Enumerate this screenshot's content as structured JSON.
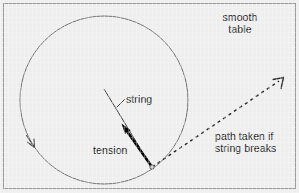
{
  "figure": {
    "background_color": "#eeeeee",
    "border_color": "#9a9a9a",
    "ink_color": "#1a1a1a",
    "thin_line_color": "#6e6e6e",
    "labels": {
      "smooth_table": "smooth\ntable",
      "string": "string",
      "tension": "tension",
      "path_broken": "path taken if\nstring breaks"
    },
    "geometry": {
      "frame": {
        "x": 3,
        "y": 3,
        "width": 293,
        "height": 186
      },
      "circle": {
        "cx": 104,
        "cy": 100,
        "r": 84
      },
      "particle": {
        "x": 152,
        "y": 167
      },
      "tension_arrow": {
        "x1": 152,
        "y1": 167,
        "x2": 122,
        "y2": 125
      },
      "string_line": {
        "x1": 152,
        "y1": 167,
        "x2": 104,
        "y2": 89
      },
      "string_leader": {
        "x1": 117,
        "y1": 107,
        "x2": 125,
        "y2": 99
      },
      "dashed_path": {
        "x1": 152,
        "y1": 167,
        "x2": 283,
        "y2": 78
      },
      "motion_arrow": {
        "x": 33,
        "y": 145
      }
    }
  }
}
